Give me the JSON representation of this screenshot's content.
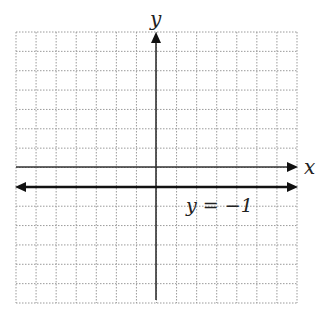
{
  "chart_data": {
    "type": "line",
    "title": "",
    "xlabel": "x",
    "ylabel": "y",
    "xlim": [
      -7,
      7
    ],
    "ylim": [
      -7,
      7
    ],
    "grid": true,
    "series": [
      {
        "name": "y = −1",
        "x": [
          -7,
          7
        ],
        "y": [
          -1,
          -1
        ],
        "style": "horizontal line with arrows both ends"
      }
    ],
    "annotations": [
      {
        "text": "y = −1",
        "x": 2.5,
        "y": -2
      }
    ]
  },
  "labels": {
    "x_axis": "x",
    "y_axis": "y",
    "line_label": "y = −1"
  }
}
